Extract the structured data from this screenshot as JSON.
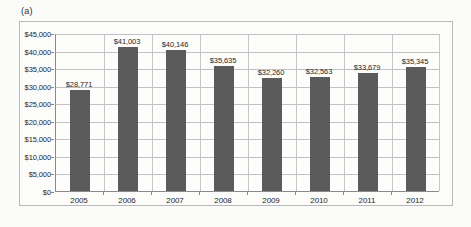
{
  "figure": {
    "panel_label": "(a)"
  },
  "chart_data": {
    "type": "bar",
    "title": "",
    "xlabel": "",
    "ylabel": "",
    "categories": [
      "2005",
      "2006",
      "2007",
      "2008",
      "2009",
      "2010",
      "2011",
      "2012"
    ],
    "values": [
      28771,
      41003,
      40146,
      35635,
      32260,
      32563,
      33679,
      35345
    ],
    "data_labels": [
      "$28,771",
      "$41,003",
      "$40,146",
      "$35,635",
      "$32,260",
      "$32,563",
      "$33,679",
      "$35,345"
    ],
    "ylim": [
      0,
      45000
    ],
    "ytick_values": [
      0,
      5000,
      10000,
      15000,
      20000,
      25000,
      30000,
      35000,
      40000,
      45000
    ],
    "ytick_labels": [
      "$0",
      "$5,000",
      "$10,000",
      "$15,000",
      "$20,000",
      "$25,000",
      "$30,000",
      "$35,000",
      "$40,000",
      "$45,000"
    ],
    "grid": true,
    "legend": false,
    "legend_position": "none",
    "series": [
      {
        "name": "",
        "color": "#5b5b5b",
        "values": [
          28771,
          41003,
          40146,
          35635,
          32260,
          32563,
          33679,
          35345
        ]
      }
    ]
  },
  "colors": {
    "bar": "#5b5b5b",
    "gridline": "#c2c2c2",
    "axis": "#8a8a8a",
    "frame": "#b9b9b9",
    "background": "#fbfbfa",
    "text": "#1f1f1f"
  }
}
